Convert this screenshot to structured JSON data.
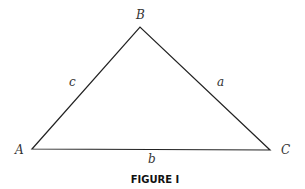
{
  "figure": {
    "caption": "FIGURE I",
    "vertices": [
      {
        "label": "A",
        "x": 32,
        "y": 149
      },
      {
        "label": "B",
        "x": 140,
        "y": 27
      },
      {
        "label": "C",
        "x": 270,
        "y": 150
      }
    ],
    "sides": [
      {
        "label": "a",
        "between": "B-C"
      },
      {
        "label": "b",
        "between": "A-C"
      },
      {
        "label": "c",
        "between": "A-B"
      }
    ],
    "line_color": "#222222"
  }
}
